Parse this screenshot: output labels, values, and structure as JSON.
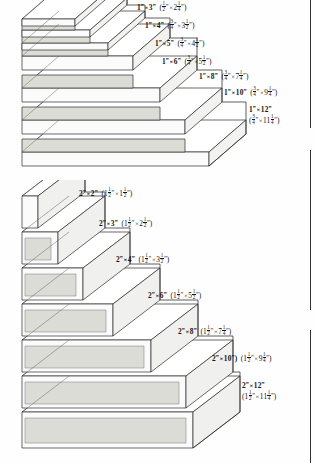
{
  "figure_1x": {
    "name": "one-inch-nominal-lumber-staircase",
    "board_count": 7,
    "labels": [
      {
        "id": "1x3",
        "nominal": "1\" × 3\"",
        "nominal_w": "1",
        "nominal_h": "3",
        "actual": "(½\" × 2¼\")",
        "actual_w_whole": "",
        "actual_w_num": "1",
        "actual_w_den": "2",
        "actual_h_whole": "2",
        "actual_h_num": "1",
        "actual_h_den": "4",
        "two_line": false
      },
      {
        "id": "1x4",
        "nominal": "1\" × 4\"",
        "nominal_w": "1",
        "nominal_h": "4",
        "actual": "(¾\" × 3½\")",
        "actual_w_whole": "",
        "actual_w_num": "3",
        "actual_w_den": "4",
        "actual_h_whole": "3",
        "actual_h_num": "1",
        "actual_h_den": "2",
        "two_line": false
      },
      {
        "id": "1x5",
        "nominal": "1\" × 5\"",
        "nominal_w": "1",
        "nominal_h": "5",
        "actual": "(¾\" × 4½\")",
        "actual_w_whole": "",
        "actual_w_num": "3",
        "actual_w_den": "4",
        "actual_h_whole": "4",
        "actual_h_num": "1",
        "actual_h_den": "2",
        "two_line": false
      },
      {
        "id": "1x6",
        "nominal": "1\" × 6\"",
        "nominal_w": "1",
        "nominal_h": "6",
        "actual": "(¾\" × 5½\")",
        "actual_w_whole": "",
        "actual_w_num": "3",
        "actual_w_den": "4",
        "actual_h_whole": "5",
        "actual_h_num": "1",
        "actual_h_den": "2",
        "two_line": false
      },
      {
        "id": "1x8",
        "nominal": "1\" × 8\"",
        "nominal_w": "1",
        "nominal_h": "8",
        "actual": "(¾\" × 7¼\")",
        "actual_w_whole": "",
        "actual_w_num": "3",
        "actual_w_den": "4",
        "actual_h_whole": "7",
        "actual_h_num": "1",
        "actual_h_den": "4",
        "two_line": false
      },
      {
        "id": "1x10",
        "nominal": "1\" × 10\"",
        "nominal_w": "1",
        "nominal_h": "10",
        "actual": "(¾\" × 9¼\")",
        "actual_w_whole": "",
        "actual_w_num": "3",
        "actual_w_den": "4",
        "actual_h_whole": "9",
        "actual_h_num": "1",
        "actual_h_den": "4",
        "two_line": false
      },
      {
        "id": "1x12",
        "nominal": "1\" × 12\"",
        "nominal_w": "1",
        "nominal_h": "12",
        "actual": "(¾\" × 11¼\")",
        "actual_w_whole": "",
        "actual_w_num": "3",
        "actual_w_den": "4",
        "actual_h_whole": "11",
        "actual_h_num": "1",
        "actual_h_den": "4",
        "two_line": true
      }
    ]
  },
  "figure_2x": {
    "name": "two-inch-nominal-lumber-staircase",
    "board_count": 7,
    "labels": [
      {
        "id": "2x2",
        "nominal": "2\" × 2\"",
        "nominal_w": "2",
        "nominal_h": "2",
        "actual": "(1½\" × 1½\")",
        "actual_w_whole": "1",
        "actual_w_num": "1",
        "actual_w_den": "2",
        "actual_h_whole": "1",
        "actual_h_num": "1",
        "actual_h_den": "2",
        "two_line": false,
        "extra_paren": false
      },
      {
        "id": "2x3",
        "nominal": "2\" × 3\"",
        "nominal_w": "2",
        "nominal_h": "3",
        "actual": "(1½\" × 2½\")",
        "actual_w_whole": "1",
        "actual_w_num": "1",
        "actual_w_den": "2",
        "actual_h_whole": "2",
        "actual_h_num": "1",
        "actual_h_den": "2",
        "two_line": false,
        "extra_paren": false
      },
      {
        "id": "2x4",
        "nominal": "2\" × 4\"",
        "nominal_w": "2",
        "nominal_h": "4",
        "actual": "(1½\" × 3½\")",
        "actual_w_whole": "1",
        "actual_w_num": "1",
        "actual_w_den": "2",
        "actual_h_whole": "3",
        "actual_h_num": "1",
        "actual_h_den": "2",
        "two_line": false,
        "extra_paren": false
      },
      {
        "id": "2x6",
        "nominal": "2\" × 6\"",
        "nominal_w": "2",
        "nominal_h": "6",
        "actual": "(1½\" × 5½\")",
        "actual_w_whole": "1",
        "actual_w_num": "1",
        "actual_w_den": "2",
        "actual_h_whole": "5",
        "actual_h_num": "1",
        "actual_h_den": "2",
        "two_line": false,
        "extra_paren": false
      },
      {
        "id": "2x8",
        "nominal": "2\" × 8\"",
        "nominal_w": "2",
        "nominal_h": "8",
        "actual": "(1½\" × 7¼\")",
        "actual_w_whole": "1",
        "actual_w_num": "1",
        "actual_w_den": "2",
        "actual_h_whole": "7",
        "actual_h_num": "1",
        "actual_h_den": "4",
        "two_line": false,
        "extra_paren": false
      },
      {
        "id": "2x10",
        "nominal": "2\" × 10\")",
        "nominal_w": "2",
        "nominal_h": "10",
        "actual": "(1½\" × 9¼\")",
        "actual_w_whole": "1",
        "actual_w_num": "1",
        "actual_w_den": "2",
        "actual_h_whole": "9",
        "actual_h_num": "1",
        "actual_h_den": "4",
        "two_line": false,
        "extra_paren": true
      },
      {
        "id": "2x12",
        "nominal": "2\" × 12\"",
        "nominal_w": "2",
        "nominal_h": "12",
        "actual": "(1½\" × 11¼\")",
        "actual_w_whole": "1",
        "actual_w_num": "1",
        "actual_w_den": "2",
        "actual_h_whole": "11",
        "actual_h_num": "1",
        "actual_h_den": "4",
        "two_line": true,
        "extra_paren": false
      }
    ]
  },
  "symbols": {
    "times": "×",
    "inch_mark": "”",
    "open_paren": "(",
    "close_paren": ")"
  },
  "colors": {
    "ink": "#141414",
    "outline": "#2b2b2b",
    "board_top": "#ffffff",
    "board_front": "#fafafa",
    "board_end_shaded": "#d9d9d4",
    "page": "#fefefe"
  }
}
